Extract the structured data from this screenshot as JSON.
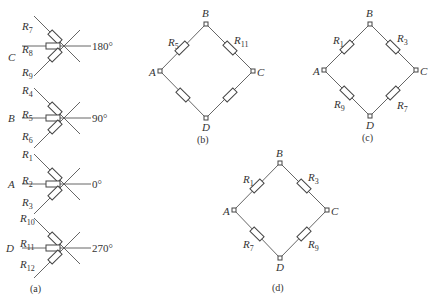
{
  "figure": {
    "panel_a": {
      "caption": "(a)",
      "rosettes": [
        {
          "node": "C",
          "angle": "180°",
          "resistors": [
            "R7",
            "R8",
            "R9"
          ]
        },
        {
          "node": "B",
          "angle": "90°",
          "resistors": [
            "R4",
            "R5",
            "R6"
          ]
        },
        {
          "node": "A",
          "angle": "0°",
          "resistors": [
            "R1",
            "R2",
            "R3"
          ]
        },
        {
          "node": "D",
          "angle": "270°",
          "resistors": [
            "R10",
            "R11",
            "R12"
          ]
        }
      ]
    },
    "panel_b": {
      "caption": "(b)",
      "nodes": {
        "top": "B",
        "left": "A",
        "right": "C",
        "bottom": "D"
      },
      "arms": {
        "AB": "R5",
        "BC": "R11",
        "AD": "",
        "DC": ""
      }
    },
    "panel_c": {
      "caption": "(c)",
      "nodes": {
        "top": "B",
        "left": "A",
        "right": "C",
        "bottom": "D"
      },
      "arms": {
        "AB": "R1",
        "BC": "R3",
        "AD": "R9",
        "DC": "R7"
      }
    },
    "panel_d": {
      "caption": "(d)",
      "nodes": {
        "top": "B",
        "left": "A",
        "right": "C",
        "bottom": "D"
      },
      "arms": {
        "AB": "R1",
        "BC": "R3",
        "AD": "R7",
        "DC": "R9"
      }
    }
  }
}
